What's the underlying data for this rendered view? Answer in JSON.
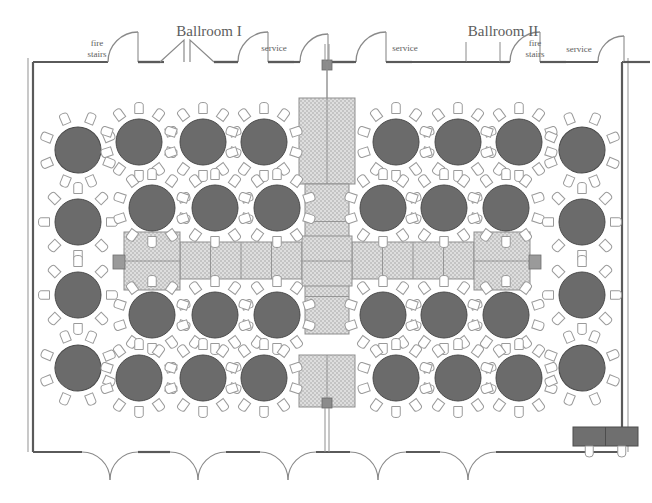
{
  "plan": {
    "title": "Ballroom Banquet Floor Plan",
    "rooms": [
      {
        "name": "Ballroom I",
        "x": 209,
        "y": 36
      },
      {
        "name": "Ballroom II",
        "x": 503,
        "y": 36
      }
    ],
    "wall_labels": [
      {
        "text": "fire",
        "x": 97,
        "y": 46
      },
      {
        "text": "stairs",
        "x": 97,
        "y": 57
      },
      {
        "text": "service",
        "x": 274,
        "y": 51
      },
      {
        "text": "service",
        "x": 405,
        "y": 51
      },
      {
        "text": "fire",
        "x": 535,
        "y": 46
      },
      {
        "text": "stairs",
        "x": 535,
        "y": 57
      },
      {
        "text": "service",
        "x": 579,
        "y": 52
      }
    ],
    "colors": {
      "wall": "#5a5a5a",
      "door_arc": "#8a8a8a",
      "round_table_fill": "#6b6b6b",
      "round_table_stroke": "#4a4a4a",
      "chair_fill": "#ffffff",
      "chair_stroke": "#9a9a9a",
      "buffet_fill": "#d6d6d6",
      "buffet_stroke": "#8f8f8f",
      "head_table_fill": "#6f6f6f",
      "pillar_fill": "#8b8b8b",
      "label_text": "#5d5d5d",
      "background": "#ffffff"
    },
    "counts": {
      "round_tables": 24,
      "round_tables_left_column": 4,
      "round_tables_right_column": 4,
      "round_tables_inner_grid": 16,
      "buffet_segments": 19,
      "head_tables": 2,
      "bottom_double_doors": 5,
      "pillars": 2
    },
    "round_tables": [
      {
        "cx": 78,
        "cy": 150,
        "r": 23,
        "seats": 8,
        "rot": 22
      },
      {
        "cx": 78,
        "cy": 222,
        "r": 23,
        "seats": 8,
        "rot": 0
      },
      {
        "cx": 78,
        "cy": 295,
        "r": 23,
        "seats": 8,
        "rot": 0
      },
      {
        "cx": 78,
        "cy": 368,
        "r": 23,
        "seats": 8,
        "rot": -22
      },
      {
        "cx": 139,
        "cy": 142,
        "r": 23,
        "seats": 10,
        "rot": 0
      },
      {
        "cx": 203,
        "cy": 142,
        "r": 23,
        "seats": 10,
        "rot": 0
      },
      {
        "cx": 264,
        "cy": 142,
        "r": 23,
        "seats": 10,
        "rot": 0
      },
      {
        "cx": 152,
        "cy": 208,
        "r": 23,
        "seats": 10,
        "rot": 0
      },
      {
        "cx": 215,
        "cy": 208,
        "r": 23,
        "seats": 10,
        "rot": 0
      },
      {
        "cx": 277,
        "cy": 208,
        "r": 23,
        "seats": 10,
        "rot": 0
      },
      {
        "cx": 396,
        "cy": 142,
        "r": 23,
        "seats": 10,
        "rot": 0
      },
      {
        "cx": 458,
        "cy": 142,
        "r": 23,
        "seats": 10,
        "rot": 0
      },
      {
        "cx": 519,
        "cy": 142,
        "r": 23,
        "seats": 10,
        "rot": 0
      },
      {
        "cx": 383,
        "cy": 208,
        "r": 23,
        "seats": 10,
        "rot": 0
      },
      {
        "cx": 444,
        "cy": 208,
        "r": 23,
        "seats": 10,
        "rot": 0
      },
      {
        "cx": 506,
        "cy": 208,
        "r": 23,
        "seats": 10,
        "rot": 0
      },
      {
        "cx": 152,
        "cy": 315,
        "r": 23,
        "seats": 10,
        "rot": 0
      },
      {
        "cx": 215,
        "cy": 315,
        "r": 23,
        "seats": 10,
        "rot": 0
      },
      {
        "cx": 277,
        "cy": 315,
        "r": 23,
        "seats": 10,
        "rot": 0
      },
      {
        "cx": 139,
        "cy": 378,
        "r": 23,
        "seats": 10,
        "rot": 0
      },
      {
        "cx": 203,
        "cy": 378,
        "r": 23,
        "seats": 10,
        "rot": 0
      },
      {
        "cx": 264,
        "cy": 378,
        "r": 23,
        "seats": 10,
        "rot": 0
      },
      {
        "cx": 383,
        "cy": 315,
        "r": 23,
        "seats": 10,
        "rot": 0
      },
      {
        "cx": 444,
        "cy": 315,
        "r": 23,
        "seats": 10,
        "rot": 0
      },
      {
        "cx": 506,
        "cy": 315,
        "r": 23,
        "seats": 10,
        "rot": 0
      },
      {
        "cx": 396,
        "cy": 378,
        "r": 23,
        "seats": 10,
        "rot": 0
      },
      {
        "cx": 458,
        "cy": 378,
        "r": 23,
        "seats": 10,
        "rot": 0
      },
      {
        "cx": 519,
        "cy": 378,
        "r": 23,
        "seats": 10,
        "rot": 0
      },
      {
        "cx": 582,
        "cy": 150,
        "r": 23,
        "seats": 8,
        "rot": -22
      },
      {
        "cx": 582,
        "cy": 222,
        "r": 23,
        "seats": 8,
        "rot": 0
      },
      {
        "cx": 582,
        "cy": 295,
        "r": 23,
        "seats": 8,
        "rot": 0
      },
      {
        "cx": 582,
        "cy": 368,
        "r": 23,
        "seats": 8,
        "rot": 22
      }
    ],
    "buffet": {
      "vertical_top": {
        "x": 299,
        "y": 98,
        "w": 56,
        "h": 86,
        "splits": 1
      },
      "vertical_mid": {
        "x": 305,
        "y": 184,
        "w": 44,
        "h": 150,
        "splits": 3
      },
      "vertical_bottom": {
        "x": 299,
        "y": 355,
        "w": 56,
        "h": 52,
        "splits": 1
      },
      "horizontal_left": {
        "x": 180,
        "y": 242,
        "w": 122,
        "h": 37,
        "splits": 3
      },
      "horizontal_right": {
        "x": 352,
        "y": 242,
        "w": 122,
        "h": 37,
        "splits": 3
      },
      "cross_center": {
        "x": 302,
        "y": 236,
        "w": 50,
        "h": 50
      }
    },
    "head_tables": [
      {
        "x": 124,
        "y": 232,
        "w": 56,
        "h": 58,
        "label": "head-table-left"
      },
      {
        "x": 474,
        "y": 232,
        "w": 56,
        "h": 58,
        "label": "head-table-right"
      }
    ],
    "lectern_blocks": [
      {
        "x": 113,
        "y": 255,
        "w": 12,
        "h": 14
      },
      {
        "x": 529,
        "y": 255,
        "w": 12,
        "h": 14
      }
    ],
    "pillars": [
      {
        "x": 322,
        "y": 60,
        "w": 10,
        "h": 10
      },
      {
        "x": 322,
        "y": 398,
        "w": 10,
        "h": 10
      }
    ],
    "registration_table": {
      "x": 573,
      "y": 427,
      "w": 65,
      "h": 19,
      "seats": 2
    },
    "walls": {
      "left_x": 33,
      "right_x": 622,
      "top_y": 62,
      "bottom_y": 452,
      "outer_left_x": 23,
      "outer_right_x": 632,
      "outer_top_y": 0,
      "outer_bottom_y": 503
    },
    "top_openings": [
      {
        "type": "door-swing",
        "x": 108,
        "w": 30,
        "dir": "right",
        "label": "fire stairs door"
      },
      {
        "type": "double-leaf",
        "x": 160,
        "w": 54,
        "label": "Ballroom I entry"
      },
      {
        "type": "door-swing",
        "x": 238,
        "w": 30,
        "dir": "right",
        "label": "service door"
      },
      {
        "type": "door-swing",
        "x": 300,
        "w": 28,
        "dir": "right",
        "label": "center service"
      },
      {
        "type": "door-swing",
        "x": 356,
        "w": 30,
        "dir": "right",
        "label": "service door"
      },
      {
        "type": "opening",
        "x": 466,
        "w": 34,
        "label": "Ballroom II entry"
      },
      {
        "type": "door-swing",
        "x": 510,
        "w": 30,
        "dir": "right",
        "label": "fire stairs door"
      },
      {
        "type": "door-swing",
        "x": 598,
        "w": 26,
        "dir": "right",
        "label": "service door"
      }
    ],
    "bottom_doors": [
      {
        "cx": 110,
        "w": 56
      },
      {
        "cx": 198,
        "w": 56
      },
      {
        "cx": 288,
        "w": 56
      },
      {
        "cx": 378,
        "w": 56
      },
      {
        "cx": 468,
        "w": 56
      }
    ]
  }
}
